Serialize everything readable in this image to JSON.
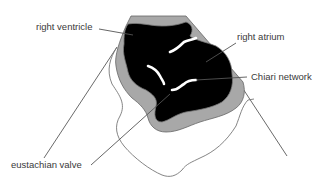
{
  "figure": {
    "type": "echocardiogram schematic (sector view)",
    "colors": {
      "background": "#ffffff",
      "cavity": "#000000",
      "myocardium_wall": "#a8a8a8",
      "outline": "#666666",
      "label_text": "#3a3a3a",
      "structure_highlight": "#ffffff"
    }
  },
  "labels": {
    "right_ventricle": "right ventricle",
    "right_atrium": "right atrium",
    "chiari_network": "Chiari network",
    "eustachian_valve": "eustachian valve"
  }
}
